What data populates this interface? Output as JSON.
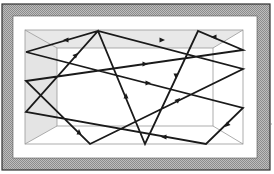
{
  "figure": {
    "colors": {
      "frame_hatch": "#a8a8a8",
      "frame_border": "#333333",
      "ceiling_fill": "#e8e8e8",
      "side_wall_fill": "#e4e4e4",
      "room_edge": "#999999",
      "ray": "#1a1a1a"
    },
    "outer_frame": {
      "x": 2,
      "y": 4,
      "w": 268,
      "h": 166
    },
    "inner_white": {
      "x": 13,
      "y": 16,
      "w": 244,
      "h": 142
    },
    "room_front": {
      "x": 25,
      "y": 30,
      "w": 218,
      "h": 114
    },
    "room_back": {
      "x": 57,
      "y": 48,
      "w": 156,
      "h": 78
    },
    "ray_path": [
      [
        26,
        52
      ],
      [
        243,
        108
      ],
      [
        206,
        144
      ],
      [
        26,
        112
      ],
      [
        98,
        31
      ],
      [
        145,
        144
      ],
      [
        198,
        31
      ],
      [
        243,
        50
      ],
      [
        26,
        81
      ],
      [
        90,
        144
      ],
      [
        243,
        69
      ],
      [
        98,
        31
      ],
      [
        26,
        52
      ]
    ],
    "arrows": [
      {
        "x": 66,
        "y": 40,
        "dir": "left"
      },
      {
        "x": 148,
        "y": 83,
        "dir": "right"
      },
      {
        "x": 227,
        "y": 125,
        "dir": "down-left"
      },
      {
        "x": 164,
        "y": 137,
        "dir": "left"
      },
      {
        "x": 76,
        "y": 55,
        "dir": "up-right"
      },
      {
        "x": 126,
        "y": 96,
        "dir": "up"
      },
      {
        "x": 176,
        "y": 76,
        "dir": "down"
      },
      {
        "x": 214,
        "y": 37,
        "dir": "left"
      },
      {
        "x": 145,
        "y": 64,
        "dir": "right"
      },
      {
        "x": 79,
        "y": 132,
        "dir": "up"
      },
      {
        "x": 178,
        "y": 100,
        "dir": "up-right"
      },
      {
        "x": 162,
        "y": 40,
        "dir": "right"
      }
    ]
  }
}
